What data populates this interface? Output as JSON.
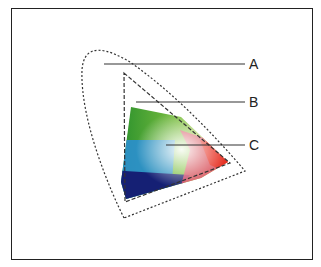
{
  "diagram": {
    "title": "",
    "labels": [
      {
        "id": "A",
        "text": "A",
        "target": "outer dotted horseshoe (visible spectrum)"
      },
      {
        "id": "B",
        "text": "B",
        "target": "dashed triangle gamut"
      },
      {
        "id": "C",
        "text": "C",
        "target": "colored gamut region"
      }
    ],
    "colors": {
      "frame": "#222222",
      "line": "#333333"
    }
  }
}
